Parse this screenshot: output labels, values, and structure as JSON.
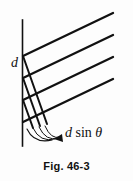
{
  "figure": {
    "caption": "Fig. 46-3",
    "background_color": "#fdfdfd",
    "ink_color": "#111111",
    "width": 133,
    "height": 181
  },
  "labels": {
    "grating_spacing": "d",
    "path_difference_var1": "d",
    "path_difference_op": "sin",
    "path_difference_var2": "θ",
    "path_difference_full": "d sin θ"
  },
  "diagram": {
    "type": "optics-diffraction-grating",
    "vertical_line": {
      "name": "grating-plane-line",
      "x": 22,
      "y_top": 20,
      "y_bottom": 146
    },
    "wavefront_rays": [
      {
        "x1": 24,
        "y1": 56,
        "x2": 113,
        "y2": 13
      },
      {
        "x1": 24,
        "y1": 78,
        "x2": 113,
        "y2": 35
      },
      {
        "x1": 24,
        "y1": 100,
        "x2": 113,
        "y2": 57
      },
      {
        "x1": 24,
        "y1": 122,
        "x2": 113,
        "y2": 79
      }
    ],
    "path_difference_segments": [
      {
        "x1": 24,
        "y1": 56,
        "x2": 44,
        "y2": 121
      },
      {
        "x1": 24,
        "y1": 78,
        "x2": 44,
        "y2": 143
      },
      {
        "x1": 24,
        "y1": 100,
        "x2": 44,
        "y2": 165
      }
    ],
    "arc_arrow": {
      "name": "path-difference-arrow",
      "description": "curved arrow sweeping from grating plane toward d sin theta label"
    }
  }
}
